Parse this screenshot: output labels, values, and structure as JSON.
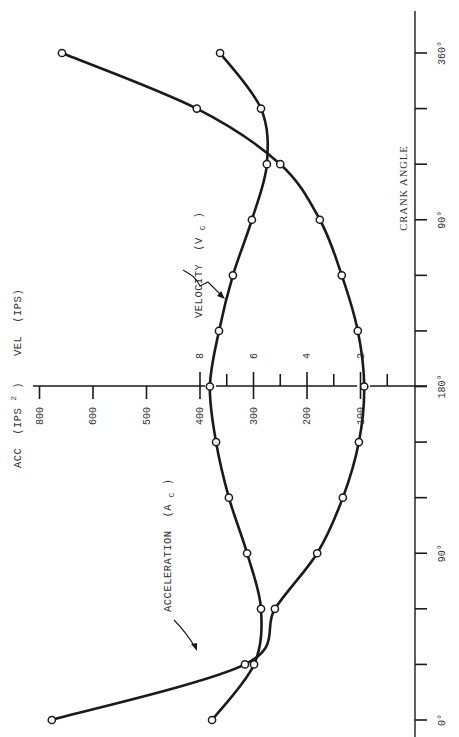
{
  "chart_data": {
    "type": "line",
    "orientation": "rotated-90-ccw",
    "x": [
      0,
      30,
      60,
      90,
      120,
      150,
      180,
      210,
      240,
      270,
      300,
      330,
      360
    ],
    "xlabel": "CRANK ANGLE",
    "xlim": [
      0,
      360
    ],
    "x_tick_labels": [
      {
        "value": 0,
        "label": "0°"
      },
      {
        "value": 90,
        "label": "90°"
      },
      {
        "value": 180,
        "label": "180°"
      },
      {
        "value": 270,
        "label": "90°"
      },
      {
        "value": 360,
        "label": "360°"
      }
    ],
    "x_ticks": [
      0,
      30,
      60,
      90,
      120,
      150,
      180,
      210,
      240,
      270,
      300,
      330,
      360
    ],
    "y_axes": [
      {
        "name": "acc",
        "label_main": "ACC",
        "label_unit": "(IPS",
        "label_sup": "2",
        "label_close": ")",
        "ticks": [
          {
            "value": 700,
            "label": "800"
          },
          {
            "value": 600,
            "label": "600"
          },
          {
            "value": 500,
            "label": "500"
          },
          {
            "value": 400,
            "label": "400"
          },
          {
            "value": 300,
            "label": "300"
          },
          {
            "value": 200,
            "label": "200"
          },
          {
            "value": 100,
            "label": "100"
          }
        ],
        "lim": [
          0,
          770
        ]
      },
      {
        "name": "vel",
        "label_main": "VEL",
        "label_unit": "(IPS)",
        "ticks": [
          {
            "value": 8,
            "label": "8"
          },
          {
            "value": 6,
            "label": "6"
          },
          {
            "value": 4,
            "label": "4"
          },
          {
            "value": 2,
            "label": "2"
          }
        ],
        "minor_ticks": [
          7,
          5,
          3,
          1
        ],
        "lim": [
          0,
          15.4
        ]
      }
    ],
    "series": [
      {
        "name": "Velocity (Vc)",
        "label_main": "VELOCITY",
        "label_paren": "(V",
        "label_sub": "C",
        "label_close": ")",
        "axis": "vel",
        "values": [
          7.55,
          5.98,
          5.72,
          6.24,
          6.92,
          7.4,
          7.63,
          7.29,
          6.77,
          6.06,
          5.5,
          5.72,
          7.25
        ]
      },
      {
        "name": "Acceleration (Ac)",
        "label_main": "ACCELERATION",
        "label_paren": "(A",
        "label_sub": "C",
        "label_close": ")",
        "axis": "acc",
        "values": [
          677,
          316,
          260,
          181,
          133,
          103,
          93,
          105,
          135,
          176,
          250,
          406,
          658
        ]
      }
    ],
    "grid": false,
    "legend": "none (inline labels with leader arrows)"
  }
}
